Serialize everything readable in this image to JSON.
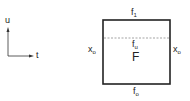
{
  "axes": {
    "vertical_label": "u",
    "horizontal_label": "t"
  },
  "box": {
    "top_label": {
      "base": "f",
      "sub": "1"
    },
    "bottom_label": {
      "base": "f",
      "sub": "o"
    },
    "left_label": {
      "base": "x",
      "sub": "o"
    },
    "right_label": {
      "base": "x",
      "sub": "o"
    },
    "dashed_label": {
      "base": "f",
      "sub": "u"
    },
    "center_label": "F"
  },
  "colors": {
    "stroke": "#222222",
    "dashed": "#666666",
    "background": "#ffffff"
  }
}
